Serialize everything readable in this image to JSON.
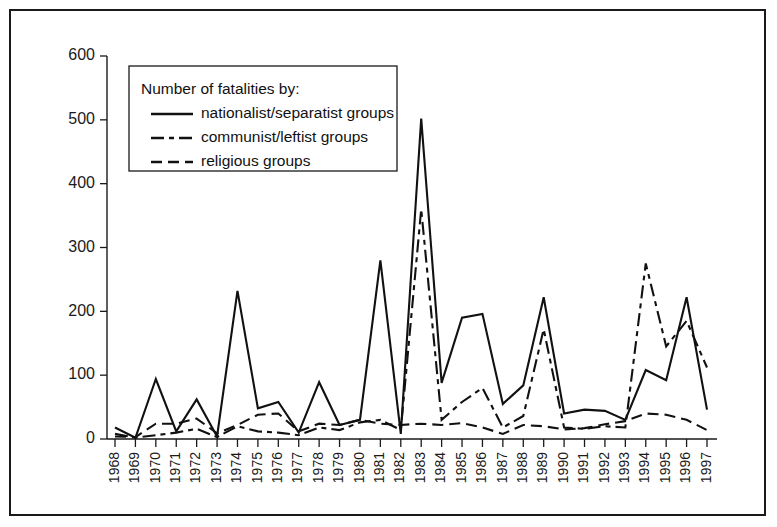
{
  "figure": {
    "border_color": "#1a1a1a",
    "background": "#ffffff"
  },
  "legend": {
    "title": "Number of fatalities by:",
    "entries": [
      {
        "label": "nationalist/separatist groups",
        "dash": "solid"
      },
      {
        "label": "communist/leftist groups",
        "dash": "long-short"
      },
      {
        "label": "religious groups",
        "dash": "long-long"
      }
    ]
  },
  "axes": {
    "y_ticks": [
      "0",
      "100",
      "200",
      "300",
      "400",
      "500",
      "600"
    ],
    "x_ticks": [
      "1968",
      "1969",
      "1970",
      "1971",
      "1972",
      "1973",
      "1974",
      "1975",
      "1976",
      "1977",
      "1978",
      "1979",
      "1980",
      "1981",
      "1982",
      "1983",
      "1984",
      "1985",
      "1986",
      "1987",
      "1988",
      "1989",
      "1990",
      "1991",
      "1992",
      "1993",
      "1994",
      "1995",
      "1996",
      "1997"
    ]
  },
  "chart_data": {
    "type": "line",
    "title": "",
    "xlabel": "",
    "ylabel": "",
    "ylim": [
      0,
      600
    ],
    "grid": false,
    "legend_position": "top-left",
    "categories": [
      1968,
      1969,
      1970,
      1971,
      1972,
      1973,
      1974,
      1975,
      1976,
      1977,
      1978,
      1979,
      1980,
      1981,
      1982,
      1983,
      1984,
      1985,
      1986,
      1987,
      1988,
      1989,
      1990,
      1991,
      1992,
      1993,
      1994,
      1995,
      1996,
      1997
    ],
    "series": [
      {
        "name": "nationalist/separatist groups",
        "dash": "solid",
        "values": [
          18,
          2,
          94,
          12,
          62,
          4,
          232,
          48,
          58,
          10,
          89,
          22,
          30,
          280,
          8,
          502,
          88,
          190,
          196,
          55,
          84,
          222,
          40,
          46,
          44,
          30,
          108,
          92,
          222,
          46
        ]
      },
      {
        "name": "communist/leftist groups",
        "dash": "long-short",
        "values": [
          8,
          2,
          6,
          10,
          16,
          3,
          20,
          12,
          10,
          6,
          18,
          14,
          26,
          30,
          14,
          360,
          30,
          58,
          80,
          18,
          36,
          172,
          18,
          16,
          20,
          18,
          275,
          145,
          185,
          112
        ]
      },
      {
        "name": "religious groups",
        "dash": "long-long",
        "values": [
          4,
          3,
          24,
          24,
          32,
          9,
          22,
          38,
          40,
          12,
          24,
          22,
          30,
          24,
          22,
          24,
          22,
          25,
          18,
          8,
          22,
          20,
          15,
          17,
          23,
          28,
          40,
          38,
          30,
          14
        ]
      }
    ]
  }
}
